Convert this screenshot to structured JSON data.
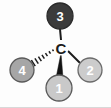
{
  "figure": {
    "width": 111,
    "height": 108,
    "background_color": "#fdfdfd",
    "bottom_rule_color": "#d8d8d8"
  },
  "center_atom": {
    "label": "C",
    "x": 61,
    "y": 48,
    "text_color": "#1c1c1c"
  },
  "substituents": [
    {
      "id": "priority-1",
      "label": "1",
      "x": 59,
      "y": 88,
      "radius": 13,
      "fill_color": "#c9c9c9",
      "stroke_color": "#5a5a5a",
      "text_color": "#ffffff",
      "font_size": 13,
      "bond_type": "solid-wedge",
      "position": "bottom"
    },
    {
      "id": "priority-2",
      "label": "2",
      "x": 90,
      "y": 70,
      "radius": 12,
      "fill_color": "#cccccc",
      "stroke_color": "#6b6b6b",
      "text_color": "#ffffff",
      "font_size": 13,
      "bond_type": "plain-line",
      "position": "lower-right"
    },
    {
      "id": "priority-3",
      "label": "3",
      "x": 60,
      "y": 16,
      "radius": 13,
      "fill_color": "#3b3b3b",
      "stroke_color": "#2a2a2a",
      "text_color": "#ffffff",
      "font_size": 13,
      "bond_type": "plain-line",
      "position": "top"
    },
    {
      "id": "priority-4",
      "label": "4",
      "x": 22,
      "y": 70,
      "radius": 12,
      "fill_color": "#a6a6a6",
      "stroke_color": "#5a5a5a",
      "text_color": "#ffffff",
      "font_size": 13,
      "bond_type": "hashed-wedge",
      "position": "lower-left"
    }
  ],
  "bonds": [
    {
      "id": "bond-to-3",
      "from": "center",
      "to": "priority-3",
      "type": "plain-line",
      "color": "#1c1c1c",
      "width": 2,
      "x1": 61,
      "y1": 40,
      "x2": 60,
      "y2": 29
    },
    {
      "id": "bond-to-2",
      "from": "center",
      "to": "priority-2",
      "type": "plain-line",
      "color": "#1c1c1c",
      "width": 2,
      "x1": 68,
      "y1": 51,
      "x2": 80,
      "y2": 63
    },
    {
      "id": "bond-to-1",
      "from": "center",
      "to": "priority-1",
      "type": "solid-wedge",
      "color": "#121212",
      "apex_x": 61,
      "apex_y": 53,
      "base_left_x": 56,
      "base_left_y": 78,
      "base_right_x": 63,
      "base_right_y": 78
    },
    {
      "id": "bond-to-4",
      "from": "center",
      "to": "priority-4",
      "type": "hashed-wedge",
      "color": "#1c1c1c",
      "dash_count": 7,
      "apex_x": 55,
      "apex_y": 49,
      "end_x": 32,
      "end_y": 64
    }
  ]
}
